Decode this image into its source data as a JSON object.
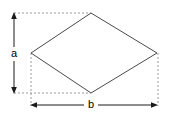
{
  "figure": {
    "name": "rhombus-with-diagonal-dimensions",
    "background_color": "#ffffff",
    "width": 172,
    "height": 119,
    "shape": {
      "name": "rhombus",
      "fill_color": "#ffffff",
      "stroke_color": "#4a4a4a",
      "vertices": [
        {
          "name": "top",
          "x": 91,
          "y": 13
        },
        {
          "name": "right",
          "x": 157,
          "y": 53
        },
        {
          "name": "bottom",
          "x": 91,
          "y": 93
        },
        {
          "name": "left",
          "x": 31,
          "y": 53
        }
      ],
      "points_attr": "91,13 157,53 91,93 31,53"
    },
    "dimensions": [
      {
        "id": "a",
        "label": "a",
        "orientation": "vertical",
        "meaning": "vertical diagonal height",
        "label_x": 14,
        "label_y": 54,
        "line_x": 14,
        "line_y1": 13,
        "line_y2": 93,
        "color": "#1a1a1a"
      },
      {
        "id": "b",
        "label": "b",
        "orientation": "horizontal",
        "meaning": "horizontal diagonal width",
        "label_x": 91,
        "label_y": 105,
        "line_y": 105,
        "line_x1": 31,
        "line_x2": 157,
        "color": "#1a1a1a"
      }
    ],
    "guides": {
      "color": "#9a9a9a",
      "dash": "2 2",
      "lines": [
        {
          "name": "guide-top-horizontal",
          "x1": 14,
          "y1": 13,
          "x2": 91,
          "y2": 13
        },
        {
          "name": "guide-bottom-horizontal",
          "x1": 14,
          "y1": 93,
          "x2": 91,
          "y2": 93
        },
        {
          "name": "guide-left-vertical",
          "x1": 31,
          "y1": 53,
          "x2": 31,
          "y2": 106
        },
        {
          "name": "guide-right-vertical",
          "x1": 158,
          "y1": 53,
          "x2": 158,
          "y2": 106
        }
      ]
    }
  }
}
